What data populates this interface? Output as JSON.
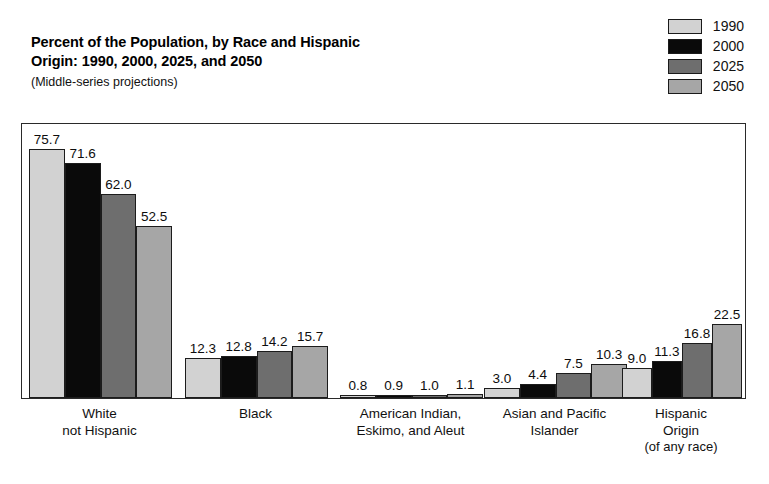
{
  "title": {
    "line1": "Percent of the Population, by Race and Hispanic",
    "line2": "Origin: 1990, 2000, 2025, and 2050",
    "subtitle": "(Middle-series projections)"
  },
  "legend": {
    "position": "top-right",
    "items": [
      {
        "label": "1990",
        "color": "#d2d2d2"
      },
      {
        "label": "2000",
        "color": "#0a0a0a"
      },
      {
        "label": "2025",
        "color": "#6e6e6e"
      },
      {
        "label": "2050",
        "color": "#a6a6a6"
      }
    ]
  },
  "chart_data": {
    "type": "bar",
    "title": "Percent of the Population, by Race and Hispanic Origin: 1990, 2000, 2025, and 2050",
    "subtitle": "(Middle-series projections)",
    "xlabel": "",
    "ylabel": "",
    "ylim": [
      0,
      84
    ],
    "grid": false,
    "legend_position": "top-right",
    "categories": [
      "White\nnot Hispanic",
      "Black",
      "American Indian,\nEskimo, and Aleut",
      "Asian and Pacific\nIslander",
      "Hispanic\nOrigin\n(of any race)"
    ],
    "category_lines": [
      [
        "White",
        "not Hispanic"
      ],
      [
        "Black"
      ],
      [
        "American Indian,",
        "Eskimo, and Aleut"
      ],
      [
        "Asian and Pacific",
        "Islander"
      ],
      [
        "Hispanic",
        "Origin",
        "(of any race)"
      ]
    ],
    "series": [
      {
        "name": "1990",
        "color": "#d2d2d2",
        "values": [
          75.7,
          12.3,
          0.8,
          3.0,
          9.0
        ]
      },
      {
        "name": "2000",
        "color": "#0a0a0a",
        "values": [
          71.6,
          12.8,
          0.9,
          4.4,
          11.3
        ]
      },
      {
        "name": "2025",
        "color": "#6e6e6e",
        "values": [
          62.0,
          14.2,
          1.0,
          7.5,
          16.8
        ]
      },
      {
        "name": "2050",
        "color": "#a6a6a6",
        "values": [
          52.5,
          15.7,
          1.1,
          10.3,
          22.5
        ]
      }
    ],
    "value_labels": [
      [
        "75.7",
        "71.6",
        "62.0",
        "52.5"
      ],
      [
        "12.3",
        "12.8",
        "14.2",
        "15.7"
      ],
      [
        "0.8",
        "0.9",
        "1.0",
        "1.1"
      ],
      [
        "3.0",
        "4.4",
        "7.5",
        "10.3"
      ],
      [
        "9.0",
        "11.3",
        "16.8",
        "22.5"
      ]
    ]
  }
}
